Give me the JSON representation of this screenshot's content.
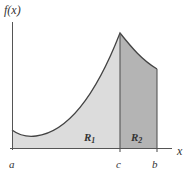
{
  "figure": {
    "y_axis_label": "f(x)",
    "x_axis_label": "x",
    "ticks": {
      "a": "a",
      "c": "c",
      "b": "b"
    },
    "regions": [
      {
        "name": "R",
        "subscript": "1",
        "color": "#dcdcdc"
      },
      {
        "name": "R",
        "subscript": "2",
        "color": "#b4b4b4"
      }
    ],
    "colors": {
      "axis": "#555555",
      "curve": "#444444",
      "region1_fill": "#dcdcdc",
      "region2_fill": "#b4b4b4"
    }
  }
}
